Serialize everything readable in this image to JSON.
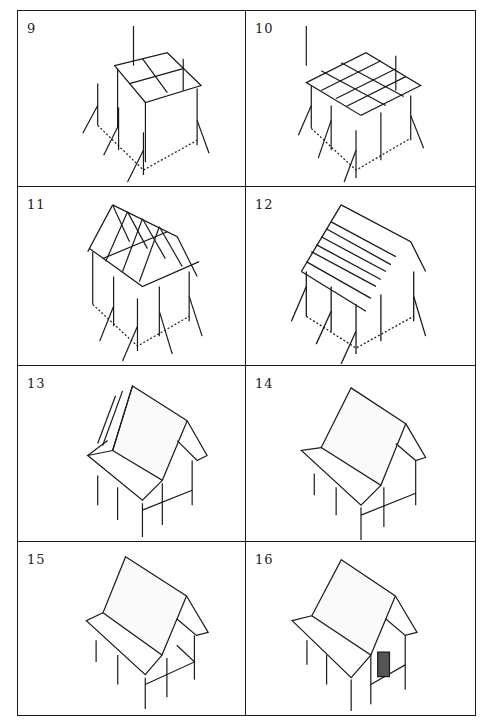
{
  "figure": {
    "layout": {
      "columns": 2,
      "rows": 4
    },
    "panels": [
      {
        "number": "9",
        "stage": "corner posts with guy ropes and first floor-frame beams"
      },
      {
        "number": "10",
        "stage": "full floor frame of crossed beams on posts, guy ropes"
      },
      {
        "number": "11",
        "stage": "gable roof rafters raised on frame"
      },
      {
        "number": "12",
        "stage": "roof battens/purlins added to rafters"
      },
      {
        "number": "13",
        "stage": "thatch being applied to roof, partially covered"
      },
      {
        "number": "14",
        "stage": "roof fully thatched, open frame beneath"
      },
      {
        "number": "15",
        "stage": "finished thatched roof on posts with floor platform"
      },
      {
        "number": "16",
        "stage": "completed house with walls and door"
      }
    ]
  },
  "colors": {
    "ink": "#1a1a1a",
    "paper": "#ffffff"
  }
}
